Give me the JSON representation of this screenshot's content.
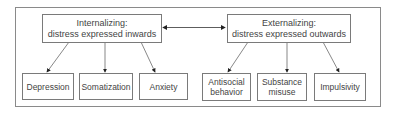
{
  "diagram": {
    "internalizing": {
      "line1": "Internalizing:",
      "line2": "distress expressed inwards"
    },
    "externalizing": {
      "line1": "Externalizing:",
      "line2": "distress expressed outwards"
    },
    "internalizing_children": [
      {
        "line1": "Depression",
        "line2": ""
      },
      {
        "line1": "Somatization",
        "line2": ""
      },
      {
        "line1": "Anxiety",
        "line2": ""
      }
    ],
    "externalizing_children": [
      {
        "line1": "Antisocial",
        "line2": "behavior"
      },
      {
        "line1": "Substance",
        "line2": "misuse"
      },
      {
        "line1": "Impulsivity",
        "line2": ""
      }
    ],
    "colors": {
      "line": "#3a3a3a",
      "border": "#7a7a7a",
      "text": "#444444"
    }
  }
}
